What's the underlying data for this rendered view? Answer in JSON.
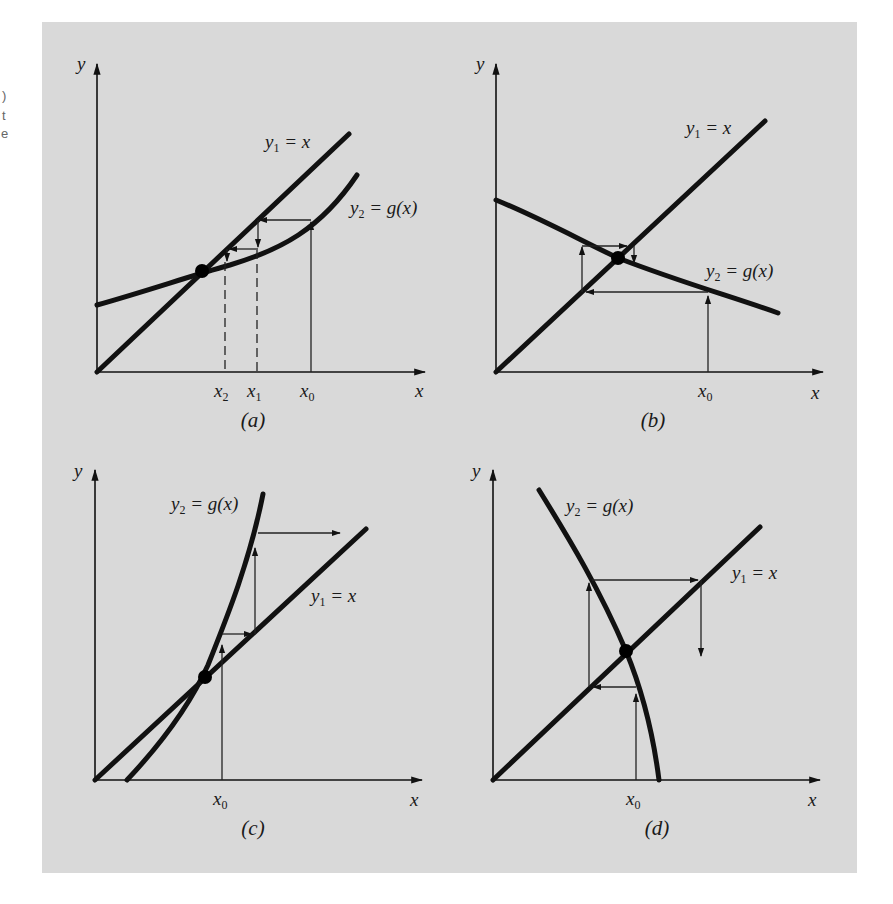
{
  "figure": {
    "background_color": "#d9d9d9",
    "ink_color": "#111111",
    "margin_fragments": [
      ")",
      "t",
      "e"
    ],
    "panels": [
      {
        "id": "a",
        "caption": "(a)",
        "axis_x_label": "x",
        "axis_y_label": "y",
        "line_label": "y",
        "line_label_sub": "1",
        "line_label_rest": " = x",
        "curve_label": "y",
        "curve_label_sub": "2",
        "curve_label_rest": " = g(x)",
        "ticks": [
          {
            "base": "x",
            "sub": "2"
          },
          {
            "base": "x",
            "sub": "1"
          },
          {
            "base": "x",
            "sub": "0"
          }
        ],
        "behavior": "monotone convergence"
      },
      {
        "id": "b",
        "caption": "(b)",
        "axis_x_label": "x",
        "axis_y_label": "y",
        "line_label": "y",
        "line_label_sub": "1",
        "line_label_rest": " = x",
        "curve_label": "y",
        "curve_label_sub": "2",
        "curve_label_rest": " = g(x)",
        "ticks": [
          {
            "base": "x",
            "sub": "0"
          }
        ],
        "behavior": "oscillating (spiral) convergence"
      },
      {
        "id": "c",
        "caption": "(c)",
        "axis_x_label": "x",
        "axis_y_label": "y",
        "line_label": "y",
        "line_label_sub": "1",
        "line_label_rest": " = x",
        "curve_label": "y",
        "curve_label_sub": "2",
        "curve_label_rest": " = g(x)",
        "ticks": [
          {
            "base": "x",
            "sub": "0"
          }
        ],
        "behavior": "monotone divergence"
      },
      {
        "id": "d",
        "caption": "(d)",
        "axis_x_label": "x",
        "axis_y_label": "y",
        "line_label": "y",
        "line_label_sub": "1",
        "line_label_rest": " = x",
        "curve_label": "y",
        "curve_label_sub": "2",
        "curve_label_rest": " = g(x)",
        "ticks": [
          {
            "base": "x",
            "sub": "0"
          }
        ],
        "behavior": "oscillating (spiral) divergence"
      }
    ]
  }
}
